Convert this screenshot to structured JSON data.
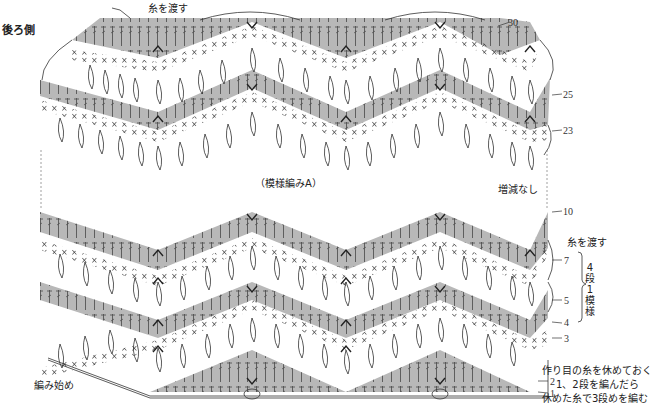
{
  "title": "後ろ側",
  "section_label": "（模様編みA）",
  "no_change_label": "増減なし",
  "pass_yarn_top": "糸を渡す",
  "pass_yarn_right": "糸を渡す",
  "start_label": "編み始め",
  "repeat_label": [
    "4",
    "段",
    "1",
    "模",
    "様"
  ],
  "notes": [
    "作り目の糸を休めておく",
    "1、2段を編んだら",
    "休めた糸で3段めを編む"
  ],
  "row_numbers": {
    "r30": "30",
    "r25": "25",
    "r23": "23",
    "r10": "10",
    "r7": "7",
    "r5": "5",
    "r4": "4",
    "r3": "3",
    "r2": "2",
    "r1": "1"
  },
  "colors": {
    "band_gray": "#b8b8b8",
    "line": "#333333",
    "background": "#ffffff"
  },
  "pattern": {
    "peaks_x": [
      158,
      346,
      530
    ],
    "valleys_x": [
      64,
      252,
      440,
      612
    ],
    "upper_block_rows": [
      "23",
      "24",
      "25",
      "26",
      "27",
      "28",
      "29",
      "30"
    ],
    "lower_block_rows": [
      "1",
      "2",
      "3",
      "4",
      "5",
      "6",
      "7",
      "8",
      "9",
      "10"
    ]
  }
}
